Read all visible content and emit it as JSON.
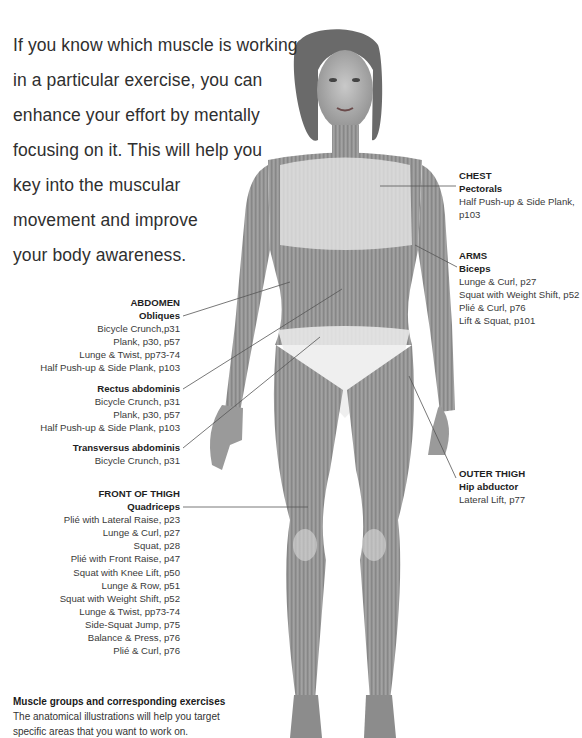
{
  "intro": {
    "lines": [
      "If you know which muscle is working",
      "in a particular exercise, you can",
      "enhance your effort by mentally",
      "focusing on it. This will help you",
      "key into the muscular",
      "movement and improve",
      "your body awareness."
    ]
  },
  "labels": {
    "chest": {
      "region": "CHEST",
      "muscles": [
        {
          "name": "Pectorals",
          "exercises": [
            "Half Push-up & Side Plank,",
            "p103"
          ]
        }
      ]
    },
    "arms": {
      "region": "ARMS",
      "muscles": [
        {
          "name": "Biceps",
          "exercises": [
            "Lunge & Curl, p27",
            "Squat with Weight Shift, p52",
            "Plié & Curl, p76",
            "Lift & Squat, p101"
          ]
        }
      ]
    },
    "abdomen": {
      "region": "ABDOMEN",
      "muscles": [
        {
          "name": "Obliques",
          "exercises": [
            "Bicycle Crunch,p31",
            "Plank, p30, p57",
            "Lunge & Twist, pp73-74",
            "Half Push-up & Side Plank, p103"
          ]
        },
        {
          "name": "Rectus abdominis",
          "exercises": [
            "Bicycle Crunch, p31",
            "Plank, p30, p57",
            "Half Push-up & Side Plank, p103"
          ]
        },
        {
          "name": "Transversus abdominis",
          "exercises": [
            "Bicycle Crunch, p31"
          ]
        }
      ]
    },
    "outer_thigh": {
      "region": "OUTER THIGH",
      "muscles": [
        {
          "name": "Hip abductor",
          "exercises": [
            "Lateral Lift, p77"
          ]
        }
      ]
    },
    "front_thigh": {
      "region": "FRONT OF THIGH",
      "muscles": [
        {
          "name": "Quadriceps",
          "exercises": [
            "Plié with Lateral Raise, p23",
            "Lunge & Curl, p27",
            "Squat, p28",
            "Plié with Front Raise, p47",
            "Squat with Knee Lift, p50",
            "Lunge & Row, p51",
            "Squat with Weight Shift, p52",
            "Lunge & Twist, pp73-74",
            "Side-Squat Jump, p75",
            "Balance & Press, p76",
            "Plié & Curl, p76"
          ]
        }
      ]
    }
  },
  "footer": {
    "title": "Muscle groups and corresponding exercises",
    "lines": [
      "The anatomical illustrations will help you target",
      "specific areas that you want to work on."
    ]
  },
  "colors": {
    "text": "#333333",
    "heading": "#1f1f1f",
    "connector": "#555555",
    "figure_skin": "#8a8a8a",
    "figure_highlight": "#e8e8e8"
  }
}
